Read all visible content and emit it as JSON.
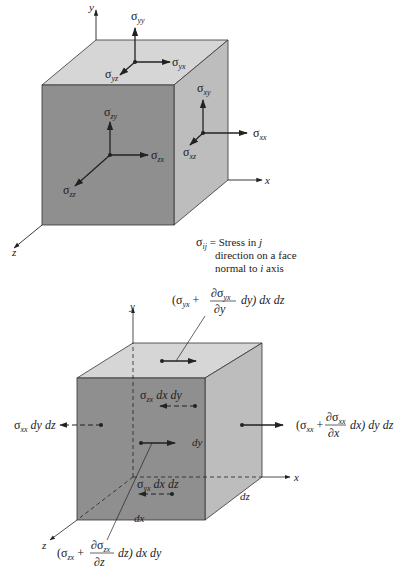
{
  "colors": {
    "front_face": "#8f8f8f",
    "top_face": "#d6d6d6",
    "side_face": "#bdbdbd",
    "edge": "#333333",
    "ink": "#222222"
  },
  "top_diagram": {
    "axes": {
      "y": "y",
      "x": "x",
      "z": "z"
    },
    "stress_labels": {
      "s_yy": {
        "sym": "σ",
        "sub": "yy"
      },
      "s_yx": {
        "sym": "σ",
        "sub": "yx"
      },
      "s_yz": {
        "sym": "σ",
        "sub": "yz"
      },
      "s_xy": {
        "sym": "σ",
        "sub": "xy"
      },
      "s_xx": {
        "sym": "σ",
        "sub": "xx"
      },
      "s_xz": {
        "sym": "σ",
        "sub": "xz"
      },
      "s_zy": {
        "sym": "σ",
        "sub": "zy"
      },
      "s_zx": {
        "sym": "σ",
        "sub": "zx"
      },
      "s_zz": {
        "sym": "σ",
        "sub": "zz"
      }
    },
    "legend": {
      "sym": "σ",
      "sub": "ij",
      "line1": " = Stress in ",
      "line1_var": "j",
      "line2": "direction on a face",
      "line3_pre": "normal to ",
      "line3_var": "i",
      "line3_post": " axis"
    }
  },
  "bottom_diagram": {
    "axes": {
      "y": "y",
      "x": "x",
      "z": "z"
    },
    "dims": {
      "dx": "dx",
      "dy": "dy",
      "dz": "dz"
    },
    "top_force": {
      "open": "(σ",
      "sub": "yx",
      "plus": " + ",
      "num": "∂σ",
      "num_sub": "yx",
      "den": "∂y",
      "tail": "dy)  dx dz"
    },
    "right_force": {
      "open": "(σ",
      "sub": "xx",
      "plus": " + ",
      "num": "∂σ",
      "num_sub": "xx",
      "den": "∂x",
      "tail": "dx)  dy dz"
    },
    "front_force": {
      "open": "(σ",
      "sub": "zx",
      "plus": " + ",
      "num": "∂σ",
      "num_sub": "zx",
      "den": "∂z",
      "tail": "dz)  dx dy"
    },
    "left_force": {
      "sym": "σ",
      "sub": "xx",
      "tail": " dy dz"
    },
    "back_force": {
      "sym": "σ",
      "sub": "zx",
      "tail": " dx dy"
    },
    "bottom_force": {
      "sym": "σ",
      "sub": "yx",
      "tail": " dx dz"
    }
  }
}
